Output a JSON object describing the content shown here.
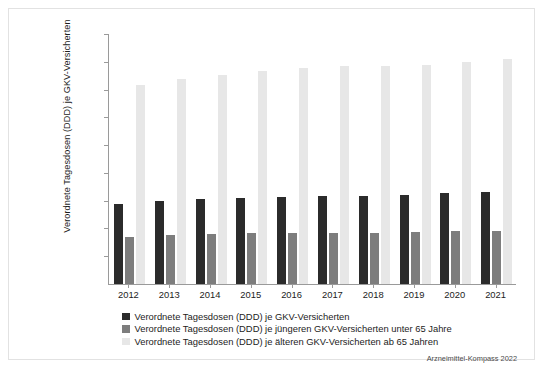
{
  "chart_data": {
    "type": "bar",
    "title": "",
    "xlabel": "",
    "ylabel": "Verordnete Tagesdosen (DDD) je GKV-Versicherten",
    "ylim": [
      0,
      1800
    ],
    "ytick_labels": [
      "1.800",
      "1.600",
      "1.400",
      "1.200",
      "1.000",
      "800",
      "600",
      "400",
      "200"
    ],
    "ytick_values": [
      1800,
      1600,
      1400,
      1200,
      1000,
      800,
      600,
      400,
      200
    ],
    "grid": false,
    "legend_position": "bottom-left",
    "categories": [
      "2012",
      "2013",
      "2014",
      "2015",
      "2016",
      "2017",
      "2018",
      "2019",
      "2020",
      "2021"
    ],
    "series": [
      {
        "name": "Verordnete Tagesdosen (DDD) je GKV-Versicherten",
        "color": "#2b2b2b",
        "values": [
          578,
          598,
          613,
          622,
          629,
          633,
          635,
          641,
          653,
          663
        ]
      },
      {
        "name": "Verordnete Tagesdosen (DDD) je jüngeren GKV-Versicherten unter 65 Jahre",
        "color": "#7d7d7d",
        "values": [
          335,
          355,
          362,
          366,
          369,
          370,
          369,
          372,
          381,
          385
        ]
      },
      {
        "name": "Verordnete Tagesdosen (DDD) je älteren GKV-Versicherten ab 65 Jahren",
        "color": "#e7e7e7",
        "values": [
          1434,
          1477,
          1505,
          1533,
          1552,
          1570,
          1572,
          1578,
          1600,
          1617
        ]
      }
    ],
    "source_note": "Arzneimittel-Kompass 2022"
  }
}
